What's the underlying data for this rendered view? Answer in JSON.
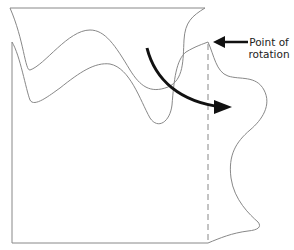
{
  "diagram": {
    "annotation": {
      "line1": "Point of",
      "line2": "rotation"
    },
    "colors": {
      "outline": "#888888",
      "arrow": "#111111",
      "text": "#222222",
      "background": "#ffffff"
    },
    "elements": [
      "upper-sheet",
      "lower-sheet",
      "rotation-axis-dashed",
      "rotation-arrow",
      "pointer-arrow"
    ]
  }
}
